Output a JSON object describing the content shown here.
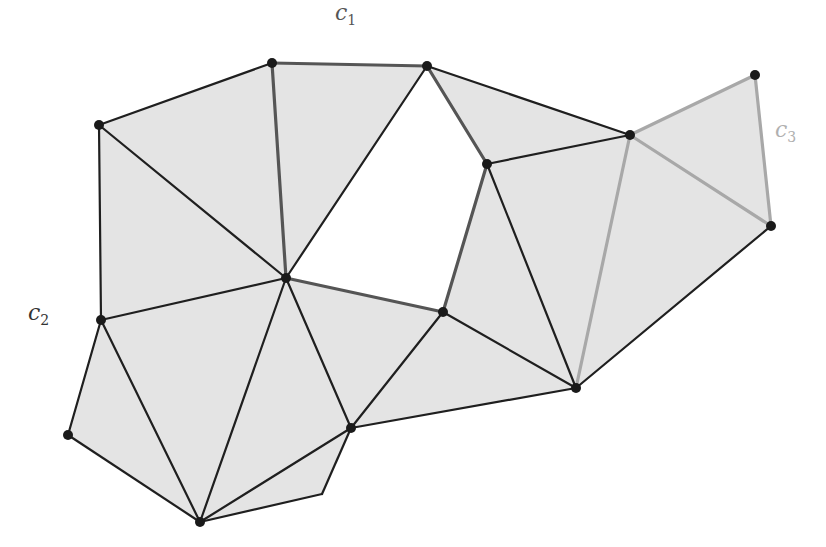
{
  "diagram": {
    "fill_color": "#e4e4e4",
    "edge_color": "#1f1f1f",
    "cycle1_color": "#555555",
    "cycle3_color": "#a8a8a8",
    "vertex_color": "#1a1a1a",
    "vertices": [
      {
        "id": "A",
        "x": 99,
        "y": 125
      },
      {
        "id": "B",
        "x": 272,
        "y": 63
      },
      {
        "id": "C",
        "x": 427,
        "y": 66
      },
      {
        "id": "D",
        "x": 487,
        "y": 164
      },
      {
        "id": "E",
        "x": 630,
        "y": 135
      },
      {
        "id": "F",
        "x": 755,
        "y": 75
      },
      {
        "id": "G",
        "x": 771,
        "y": 226
      },
      {
        "id": "H",
        "x": 286,
        "y": 278
      },
      {
        "id": "I",
        "x": 443,
        "y": 312
      },
      {
        "id": "J",
        "x": 101,
        "y": 320
      },
      {
        "id": "K",
        "x": 68,
        "y": 435
      },
      {
        "id": "L",
        "x": 200,
        "y": 522
      },
      {
        "id": "M",
        "x": 351,
        "y": 428
      },
      {
        "id": "N",
        "x": 576,
        "y": 388
      }
    ],
    "corner_points": [
      {
        "id": "P",
        "x": 322,
        "y": 494
      }
    ],
    "faces": [
      [
        "A",
        "B",
        "H"
      ],
      [
        "A",
        "H",
        "J"
      ],
      [
        "B",
        "C",
        "H"
      ],
      [
        "C",
        "E",
        "D"
      ],
      [
        "D",
        "E",
        "N"
      ],
      [
        "D",
        "N",
        "I"
      ],
      [
        "E",
        "F",
        "G"
      ],
      [
        "E",
        "G",
        "N"
      ],
      [
        "J",
        "H",
        "L"
      ],
      [
        "J",
        "L",
        "K"
      ],
      [
        "H",
        "M",
        "L"
      ],
      [
        "H",
        "I",
        "M"
      ],
      [
        "I",
        "N",
        "M"
      ],
      [
        "L",
        "M",
        "P"
      ]
    ],
    "edges": [
      {
        "from": "A",
        "to": "B",
        "style": "normal"
      },
      {
        "from": "A",
        "to": "J",
        "style": "normal"
      },
      {
        "from": "A",
        "to": "H",
        "style": "normal"
      },
      {
        "from": "B",
        "to": "C",
        "style": "cycle1"
      },
      {
        "from": "B",
        "to": "H",
        "style": "cycle1"
      },
      {
        "from": "C",
        "to": "H",
        "style": "normal"
      },
      {
        "from": "C",
        "to": "D",
        "style": "cycle1"
      },
      {
        "from": "C",
        "to": "E",
        "style": "normal"
      },
      {
        "from": "D",
        "to": "E",
        "style": "normal"
      },
      {
        "from": "D",
        "to": "I",
        "style": "cycle1"
      },
      {
        "from": "D",
        "to": "N",
        "style": "normal"
      },
      {
        "from": "H",
        "to": "I",
        "style": "cycle1"
      },
      {
        "from": "E",
        "to": "F",
        "style": "cycle3"
      },
      {
        "from": "F",
        "to": "G",
        "style": "cycle3"
      },
      {
        "from": "E",
        "to": "G",
        "style": "cycle3"
      },
      {
        "from": "E",
        "to": "N",
        "style": "cycle3"
      },
      {
        "from": "G",
        "to": "N",
        "style": "normal"
      },
      {
        "from": "J",
        "to": "H",
        "style": "normal"
      },
      {
        "from": "J",
        "to": "K",
        "style": "normal"
      },
      {
        "from": "J",
        "to": "L",
        "style": "normal"
      },
      {
        "from": "K",
        "to": "L",
        "style": "normal"
      },
      {
        "from": "H",
        "to": "L",
        "style": "normal"
      },
      {
        "from": "H",
        "to": "M",
        "style": "normal"
      },
      {
        "from": "I",
        "to": "M",
        "style": "normal"
      },
      {
        "from": "I",
        "to": "N",
        "style": "normal"
      },
      {
        "from": "M",
        "to": "N",
        "style": "normal"
      },
      {
        "from": "L",
        "to": "M",
        "style": "normal"
      },
      {
        "from": "L",
        "to": "P",
        "style": "normal"
      },
      {
        "from": "P",
        "to": "M",
        "style": "normal"
      }
    ],
    "labels": [
      {
        "id": "c1",
        "base": "c",
        "sub": "1",
        "x": 335,
        "y": 0,
        "color": "#555555"
      },
      {
        "id": "c2",
        "base": "c",
        "sub": "2",
        "x": 28,
        "y": 300,
        "color": "#333333"
      },
      {
        "id": "c3",
        "base": "c",
        "sub": "3",
        "x": 775,
        "y": 117,
        "color": "#b0b0b0"
      }
    ]
  }
}
